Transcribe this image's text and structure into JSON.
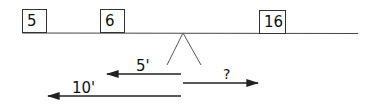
{
  "diagram": {
    "type": "lever-balance",
    "weights": [
      {
        "label": "5",
        "position": "far-left"
      },
      {
        "label": "6",
        "position": "left"
      },
      {
        "label": "16",
        "position": "right"
      }
    ],
    "distances": [
      {
        "label": "5'",
        "direction": "left"
      },
      {
        "label": "?",
        "direction": "right"
      },
      {
        "label": "10'",
        "direction": "left"
      }
    ],
    "colors": {
      "line": "#333333",
      "background": "#ffffff"
    }
  }
}
